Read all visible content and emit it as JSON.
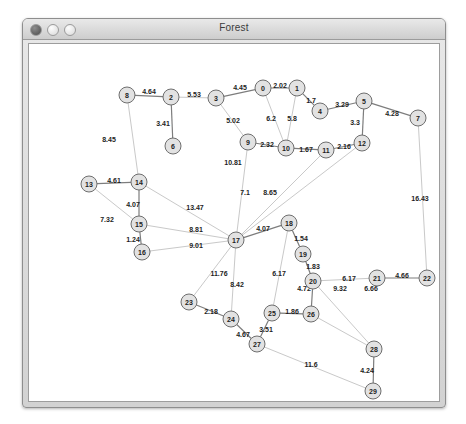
{
  "window": {
    "title": "Forest",
    "controls": [
      {
        "name": "close",
        "label": "Close"
      },
      {
        "name": "minimize",
        "label": "Minimize"
      },
      {
        "name": "zoom",
        "label": "Zoom"
      }
    ]
  },
  "colors": {
    "node_fill": "#e2e2e2",
    "node_stroke": "#6e6e6e",
    "edge_strong": "#7d7d7d",
    "edge_faint": "#c9c9c9",
    "label": "#1d1d1d",
    "window_bg": "#d2d2d2",
    "canvas_bg": "#ffffff"
  },
  "chart_data": {
    "type": "diagram",
    "title": "Forest",
    "subtitle": "",
    "layout": "node-link graph with weighted edges",
    "node_count": 30,
    "edge_count": 36,
    "nodes": [
      {
        "id": "0",
        "label": "0",
        "x": 240,
        "y": 72
      },
      {
        "id": "1",
        "label": "1",
        "x": 274,
        "y": 72
      },
      {
        "id": "2",
        "label": "2",
        "x": 148,
        "y": 81
      },
      {
        "id": "3",
        "label": "3",
        "x": 193,
        "y": 82
      },
      {
        "id": "4",
        "label": "4",
        "x": 297,
        "y": 95
      },
      {
        "id": "5",
        "label": "5",
        "x": 341,
        "y": 85
      },
      {
        "id": "6",
        "label": "6",
        "x": 150,
        "y": 130
      },
      {
        "id": "7",
        "label": "7",
        "x": 395,
        "y": 102
      },
      {
        "id": "8",
        "label": "8",
        "x": 104,
        "y": 79
      },
      {
        "id": "9",
        "label": "9",
        "x": 225,
        "y": 126
      },
      {
        "id": "10",
        "label": "10",
        "x": 263,
        "y": 132
      },
      {
        "id": "11",
        "label": "11",
        "x": 303,
        "y": 134
      },
      {
        "id": "12",
        "label": "12",
        "x": 339,
        "y": 127
      },
      {
        "id": "13",
        "label": "13",
        "x": 66,
        "y": 168
      },
      {
        "id": "14",
        "label": "14",
        "x": 116,
        "y": 166
      },
      {
        "id": "15",
        "label": "15",
        "x": 116,
        "y": 208
      },
      {
        "id": "16",
        "label": "16",
        "x": 119,
        "y": 236
      },
      {
        "id": "17",
        "label": "17",
        "x": 213,
        "y": 224
      },
      {
        "id": "18",
        "label": "18",
        "x": 266,
        "y": 207
      },
      {
        "id": "19",
        "label": "19",
        "x": 280,
        "y": 238
      },
      {
        "id": "20",
        "label": "20",
        "x": 290,
        "y": 265
      },
      {
        "id": "21",
        "label": "21",
        "x": 354,
        "y": 262
      },
      {
        "id": "22",
        "label": "22",
        "x": 404,
        "y": 262
      },
      {
        "id": "23",
        "label": "23",
        "x": 166,
        "y": 286
      },
      {
        "id": "24",
        "label": "24",
        "x": 208,
        "y": 303
      },
      {
        "id": "25",
        "label": "25",
        "x": 249,
        "y": 297
      },
      {
        "id": "26",
        "label": "26",
        "x": 288,
        "y": 298
      },
      {
        "id": "27",
        "label": "27",
        "x": 234,
        "y": 328
      },
      {
        "id": "28",
        "label": "28",
        "x": 351,
        "y": 333
      },
      {
        "id": "29",
        "label": "29",
        "x": 350,
        "y": 375
      }
    ],
    "edges": [
      {
        "source": "8",
        "target": "2",
        "weight": "4.64",
        "lx": 126,
        "ly": 75,
        "strong": true
      },
      {
        "source": "2",
        "target": "6",
        "weight": "3.41",
        "lx": 140,
        "ly": 107,
        "strong": true
      },
      {
        "source": "2",
        "target": "3",
        "weight": "5.53",
        "lx": 171,
        "ly": 78,
        "strong": false
      },
      {
        "source": "3",
        "target": "0",
        "weight": "4.45",
        "lx": 217,
        "ly": 71,
        "strong": true
      },
      {
        "source": "0",
        "target": "1",
        "weight": "2.02",
        "lx": 257,
        "ly": 69,
        "strong": true
      },
      {
        "source": "1",
        "target": "4",
        "weight": "1.7",
        "lx": 288,
        "ly": 84,
        "strong": true
      },
      {
        "source": "4",
        "target": "5",
        "weight": "3.29",
        "lx": 319,
        "ly": 88,
        "strong": true
      },
      {
        "source": "5",
        "target": "7",
        "weight": "4.28",
        "lx": 369,
        "ly": 97,
        "strong": true
      },
      {
        "source": "5",
        "target": "12",
        "weight": "3.3",
        "lx": 332,
        "ly": 106,
        "strong": true
      },
      {
        "source": "3",
        "target": "9",
        "weight": "5.02",
        "lx": 210,
        "ly": 104,
        "strong": false
      },
      {
        "source": "0",
        "target": "10",
        "weight": "6.2",
        "lx": 248,
        "ly": 102,
        "strong": false
      },
      {
        "source": "1",
        "target": "10",
        "weight": "5.8",
        "lx": 269,
        "ly": 102,
        "strong": false
      },
      {
        "source": "9",
        "target": "10",
        "weight": "2.32",
        "lx": 244,
        "ly": 128,
        "strong": true
      },
      {
        "source": "10",
        "target": "11",
        "weight": "1.67",
        "lx": 283,
        "ly": 133,
        "strong": true
      },
      {
        "source": "11",
        "target": "12",
        "weight": "2.16",
        "lx": 321,
        "ly": 130,
        "strong": true
      },
      {
        "source": "8",
        "target": "14",
        "weight": "8.45",
        "lx": 86,
        "ly": 123,
        "strong": false
      },
      {
        "source": "9",
        "target": "17",
        "weight": "10.81",
        "lx": 210,
        "ly": 146,
        "strong": false
      },
      {
        "source": "13",
        "target": "14",
        "weight": "4.61",
        "lx": 91,
        "ly": 164,
        "strong": true
      },
      {
        "source": "14",
        "target": "15",
        "weight": "4.07",
        "lx": 110,
        "ly": 188,
        "strong": true
      },
      {
        "source": "15",
        "target": "16",
        "weight": "1.24",
        "lx": 110,
        "ly": 223,
        "strong": true
      },
      {
        "source": "13",
        "target": "15",
        "weight": "7.32",
        "lx": 84,
        "ly": 203,
        "strong": false
      },
      {
        "source": "14",
        "target": "17",
        "weight": "13.47",
        "lx": 172,
        "ly": 191,
        "strong": false
      },
      {
        "source": "15",
        "target": "17",
        "weight": "8.81",
        "lx": 173,
        "ly": 213,
        "strong": false
      },
      {
        "source": "16",
        "target": "17",
        "weight": "9.01",
        "lx": 173,
        "ly": 229,
        "strong": false
      },
      {
        "source": "11",
        "target": "17",
        "weight": "7.1",
        "lx": 222,
        "ly": 176,
        "strong": false
      },
      {
        "source": "12",
        "target": "17",
        "weight": "8.65",
        "lx": 247,
        "ly": 176,
        "strong": false
      },
      {
        "source": "17",
        "target": "18",
        "weight": "4.07",
        "lx": 240,
        "ly": 212,
        "strong": true
      },
      {
        "source": "18",
        "target": "19",
        "weight": "1.54",
        "lx": 278,
        "ly": 222,
        "strong": true
      },
      {
        "source": "19",
        "target": "20",
        "weight": "1.83",
        "lx": 290,
        "ly": 250,
        "strong": true
      },
      {
        "source": "20",
        "target": "26",
        "weight": "4.72",
        "lx": 281,
        "ly": 272,
        "strong": true
      },
      {
        "source": "7",
        "target": "22",
        "weight": "16.43",
        "lx": 397,
        "ly": 182,
        "strong": false
      },
      {
        "source": "18",
        "target": "25",
        "weight": "6.17",
        "lx": 256,
        "ly": 257,
        "strong": false
      },
      {
        "source": "20",
        "target": "21",
        "weight": "6.17",
        "lx": 326,
        "ly": 262,
        "strong": false
      },
      {
        "source": "21",
        "target": "22",
        "weight": "4.66",
        "lx": 379,
        "ly": 259,
        "strong": true
      },
      {
        "source": "17",
        "target": "23",
        "weight": "11.76",
        "lx": 196,
        "ly": 257,
        "strong": false
      },
      {
        "source": "17",
        "target": "24",
        "weight": "8.42",
        "lx": 214,
        "ly": 268,
        "strong": false
      },
      {
        "source": "23",
        "target": "24",
        "weight": "2.18",
        "lx": 188,
        "ly": 295,
        "strong": true
      },
      {
        "source": "24",
        "target": "27",
        "weight": "4.67",
        "lx": 220,
        "ly": 318,
        "strong": true
      },
      {
        "source": "27",
        "target": "25",
        "weight": "3.51",
        "lx": 243,
        "ly": 313,
        "strong": true
      },
      {
        "source": "25",
        "target": "26",
        "weight": "1.86",
        "lx": 269,
        "ly": 295,
        "strong": true
      },
      {
        "source": "26",
        "target": "28",
        "weight": "9.32",
        "lx": 317,
        "ly": 272,
        "strong": false
      },
      {
        "source": "20",
        "target": "28",
        "weight": "6.66",
        "lx": 348,
        "ly": 272,
        "strong": false
      },
      {
        "source": "28",
        "target": "29",
        "weight": "4.24",
        "lx": 344,
        "ly": 354,
        "strong": true
      },
      {
        "source": "27",
        "target": "29",
        "weight": "11.6",
        "lx": 288,
        "ly": 348,
        "strong": false
      }
    ]
  }
}
